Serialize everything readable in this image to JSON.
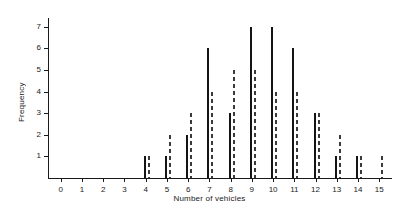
{
  "chart_data": {
    "type": "bar",
    "title": "",
    "xlabel": "Number of vehicles",
    "ylabel": "Frequency",
    "categories": [
      0,
      1,
      2,
      3,
      4,
      5,
      6,
      7,
      8,
      9,
      10,
      11,
      12,
      13,
      14,
      15
    ],
    "xtick_labels": [
      "0",
      "1",
      "2",
      "3",
      "4",
      "5",
      "6",
      "7",
      "8",
      "9",
      "10",
      "11",
      "12",
      "13",
      "14",
      "15"
    ],
    "ytick_labels": [
      "1",
      "2",
      "3",
      "4",
      "5",
      "6",
      "7"
    ],
    "xlim": [
      -0.6,
      15.6
    ],
    "ylim": [
      0,
      7.4
    ],
    "grid": false,
    "legend": "none",
    "series": [
      {
        "name": "observed",
        "style": "solid",
        "color": "#141414",
        "values": [
          0,
          0,
          0,
          0,
          1,
          1,
          2,
          6,
          3,
          7,
          7,
          6,
          3,
          1,
          1,
          0
        ]
      },
      {
        "name": "expected",
        "style": "dashed",
        "color": "#3a3a3a",
        "values": [
          0,
          0,
          0,
          0,
          1,
          2,
          3,
          4,
          5,
          5,
          4,
          4,
          3,
          2,
          1,
          1
        ]
      }
    ]
  }
}
